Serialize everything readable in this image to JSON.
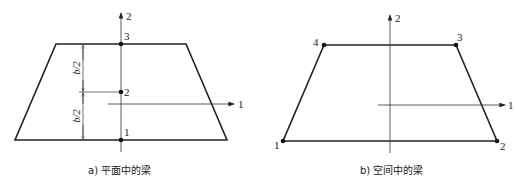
{
  "panels": [
    {
      "id": "a",
      "caption": "a) 平面中的梁",
      "axes": {
        "vertical_label": "2",
        "horizontal_label": "1"
      },
      "nodes": [
        {
          "label": "1",
          "x": 121,
          "y": 140
        },
        {
          "label": "2",
          "x": 121,
          "y": 92
        },
        {
          "label": "3",
          "x": 121,
          "y": 44
        }
      ],
      "dimensions": [
        {
          "label": "b/2",
          "from": "1",
          "to": "2"
        },
        {
          "label": "b/2",
          "from": "2",
          "to": "3"
        }
      ],
      "shape": "trapezoid"
    },
    {
      "id": "b",
      "caption": "b) 空间中的梁",
      "axes": {
        "vertical_label": "2",
        "horizontal_label": "1"
      },
      "nodes": [
        {
          "label": "1",
          "x": 283,
          "y": 141
        },
        {
          "label": "2",
          "x": 497,
          "y": 141
        },
        {
          "label": "3",
          "x": 456,
          "y": 45
        },
        {
          "label": "4",
          "x": 324,
          "y": 45
        }
      ],
      "shape": "trapezoid"
    }
  ]
}
